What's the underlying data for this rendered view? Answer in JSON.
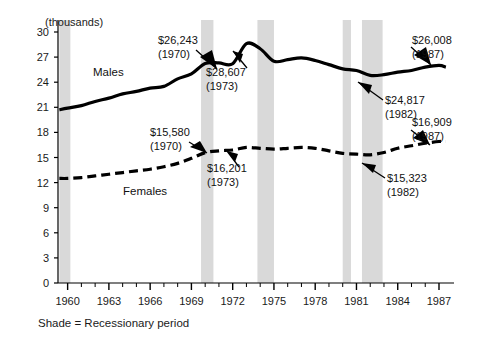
{
  "chart_data": {
    "type": "line",
    "title": "",
    "subtitle": "",
    "unit_label": "(thousands)",
    "xlabel": "",
    "ylabel": "",
    "xlim": [
      1959.3,
      1987.8
    ],
    "ylim": [
      0,
      30
    ],
    "grid": false,
    "legend_position": "inline-labels",
    "y_ticks": [
      "0",
      "3",
      "6",
      "9",
      "12",
      "15",
      "18",
      "21",
      "24",
      "27",
      "30"
    ],
    "y_tick_values": [
      0,
      3,
      6,
      9,
      12,
      15,
      18,
      21,
      24,
      27,
      30
    ],
    "x_tick_labels": [
      "1960",
      "1963",
      "1966",
      "1969",
      "1972",
      "1975",
      "1978",
      "1981",
      "1984",
      "1987"
    ],
    "x_tick_values": [
      1960,
      1963,
      1966,
      1969,
      1972,
      1975,
      1978,
      1981,
      1984,
      1987
    ],
    "x_minor_step": 1,
    "footnote": "Shade = Recessionary period",
    "series": [
      {
        "name": "Males",
        "style": "solid",
        "color": "#000000",
        "x": [
          1959.4,
          1960,
          1961,
          1962,
          1963,
          1964,
          1965,
          1966,
          1967,
          1968,
          1969,
          1970,
          1971,
          1972,
          1973,
          1974,
          1975,
          1976,
          1977,
          1978,
          1979,
          1980,
          1981,
          1982,
          1983,
          1984,
          1985,
          1986,
          1987,
          1987.5
        ],
        "values": [
          20.7,
          20.9,
          21.2,
          21.7,
          22.1,
          22.6,
          22.9,
          23.3,
          23.5,
          24.4,
          25.0,
          26.243,
          26.3,
          26.2,
          28.607,
          28.0,
          26.5,
          26.7,
          26.9,
          26.6,
          26.1,
          25.6,
          25.4,
          24.817,
          24.9,
          25.2,
          25.4,
          25.8,
          26.008,
          25.8
        ]
      },
      {
        "name": "Females",
        "style": "dashed",
        "color": "#000000",
        "x": [
          1959.4,
          1960,
          1961,
          1962,
          1963,
          1964,
          1965,
          1966,
          1967,
          1968,
          1969,
          1970,
          1971,
          1972,
          1973,
          1974,
          1975,
          1976,
          1977,
          1978,
          1979,
          1980,
          1981,
          1982,
          1983,
          1984,
          1985,
          1986,
          1987,
          1987.5
        ],
        "values": [
          12.5,
          12.5,
          12.6,
          12.8,
          13.0,
          13.2,
          13.4,
          13.6,
          13.9,
          14.3,
          14.9,
          15.58,
          15.8,
          15.9,
          16.201,
          16.1,
          16.0,
          16.1,
          16.2,
          16.1,
          15.8,
          15.5,
          15.4,
          15.323,
          15.6,
          16.1,
          16.4,
          16.7,
          16.909,
          16.9
        ]
      }
    ],
    "annotations": [
      {
        "id": "males-1970",
        "value_label": "$26,243",
        "year_label": "(1970)",
        "series": "Males",
        "x": 1970,
        "y": 26.243
      },
      {
        "id": "males-1973",
        "value_label": "$28,607",
        "year_label": "(1973)",
        "series": "Males",
        "x": 1973,
        "y": 28.607
      },
      {
        "id": "males-1982",
        "value_label": "$24,817",
        "year_label": "(1982)",
        "series": "Males",
        "x": 1982,
        "y": 24.817
      },
      {
        "id": "males-1987",
        "value_label": "$26,008",
        "year_label": "(1987)",
        "series": "Males",
        "x": 1987,
        "y": 26.008
      },
      {
        "id": "females-1970",
        "value_label": "$15,580",
        "year_label": "(1970)",
        "series": "Females",
        "x": 1970,
        "y": 15.58
      },
      {
        "id": "females-1973",
        "value_label": "$16,201",
        "year_label": "(1973)",
        "series": "Females",
        "x": 1973,
        "y": 16.201
      },
      {
        "id": "females-1982",
        "value_label": "$15,323",
        "year_label": "(1982)",
        "series": "Females",
        "x": 1982,
        "y": 15.323
      },
      {
        "id": "females-1987",
        "value_label": "$16,909",
        "year_label": "(1987)",
        "series": "Females",
        "x": 1987,
        "y": 16.909
      }
    ],
    "shaded_bands": [
      {
        "label": "recession-1960",
        "start": 1959.4,
        "end": 1960.2
      },
      {
        "label": "recession-1970",
        "start": 1969.7,
        "end": 1970.6
      },
      {
        "label": "recession-1974",
        "start": 1973.8,
        "end": 1975.0
      },
      {
        "label": "recession-1980",
        "start": 1980.0,
        "end": 1980.6
      },
      {
        "label": "recession-1982",
        "start": 1981.4,
        "end": 1982.9
      }
    ],
    "shade_color": "#d9d9d9"
  },
  "labels": {
    "unit": "(thousands)",
    "males": "Males",
    "females": "Females",
    "footnote": "Shade = Recessionary period"
  },
  "annotation_text": {
    "males_1970_value": "$26,243",
    "males_1970_year": "(1970)",
    "males_1973_value": "$28,607",
    "males_1973_year": "(1973)",
    "males_1982_value": "$24,817",
    "males_1982_year": "(1982)",
    "males_1987_value": "$26,008",
    "males_1987_year": "(1987)",
    "females_1970_value": "$15,580",
    "females_1970_year": "(1970)",
    "females_1973_value": "$16,201",
    "females_1973_year": "(1973)",
    "females_1982_value": "$15,323",
    "females_1982_year": "(1982)",
    "females_1987_value": "$16,909",
    "females_1987_year": "(1987)"
  }
}
